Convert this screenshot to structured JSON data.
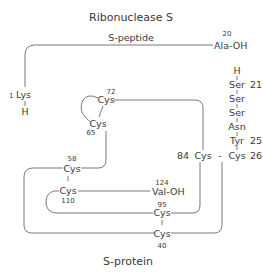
{
  "title": "Ribonuclease S",
  "s_peptide": {
    "label": "S-peptide",
    "n_terminus": {
      "number": "1",
      "residue": "Lys",
      "end": "H"
    },
    "c_terminus": {
      "number": "20",
      "residue": "Ala-OH"
    }
  },
  "s_protein": {
    "label": "S-protein",
    "n_terminal_chain": [
      {
        "residue": "H"
      },
      {
        "residue": "Ser",
        "number": "21"
      },
      {
        "residue": "Ser"
      },
      {
        "residue": "Ser"
      },
      {
        "residue": "Asn"
      },
      {
        "residue": "Tyr",
        "number": "25"
      },
      {
        "residue": "Cys",
        "number": "26"
      }
    ],
    "c_terminus": {
      "number": "124",
      "residue": "Val-OH"
    },
    "cysteines": {
      "c26": {
        "residue": "Cys",
        "number": "26"
      },
      "c40": {
        "residue": "Cys",
        "number": "40"
      },
      "c58": {
        "residue": "Cys",
        "number": "58"
      },
      "c65": {
        "residue": "Cys",
        "number": "65"
      },
      "c72": {
        "residue": "Cys",
        "number": "72"
      },
      "c84": {
        "residue": "Cys",
        "number": "84"
      },
      "c95": {
        "residue": "Cys",
        "number": "95"
      },
      "c110": {
        "residue": "Cys",
        "number": "110"
      }
    },
    "disulfide_bonds": [
      [
        "26",
        "84"
      ],
      [
        "40",
        "95"
      ],
      [
        "58",
        "110"
      ],
      [
        "65",
        "72"
      ]
    ]
  },
  "symbols": {
    "dash": "-",
    "bar": "|"
  }
}
